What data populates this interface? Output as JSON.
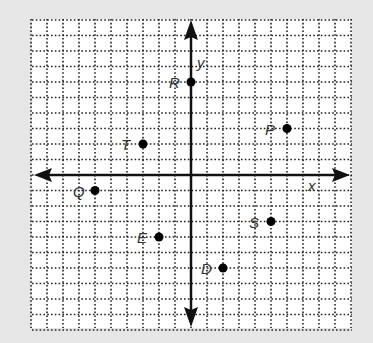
{
  "diagram": {
    "type": "coordinate-plane",
    "background_color": "#e6e6e6",
    "grid_color": "#222222",
    "grid": {
      "x_min": -10,
      "x_max": 10,
      "y_min": -10,
      "y_max": 10,
      "step": 1,
      "style": "dotted"
    },
    "axes": {
      "x_label": "x",
      "y_label": "y"
    },
    "points": [
      {
        "name": "R",
        "x": 0,
        "y": 6
      },
      {
        "name": "P",
        "x": 6,
        "y": 3
      },
      {
        "name": "T",
        "x": -3,
        "y": 2
      },
      {
        "name": "Q",
        "x": -6,
        "y": -1
      },
      {
        "name": "S",
        "x": 5,
        "y": -3
      },
      {
        "name": "E",
        "x": -2,
        "y": -4
      },
      {
        "name": "D",
        "x": 2,
        "y": -6
      }
    ]
  }
}
